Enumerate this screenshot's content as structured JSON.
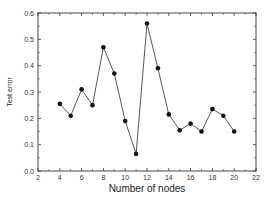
{
  "chart_data": {
    "type": "line",
    "title": "",
    "xlabel": "Number of  nodes",
    "ylabel": "Test error",
    "xlim": [
      2,
      22
    ],
    "ylim": [
      0.0,
      0.6
    ],
    "xticks": [
      2,
      4,
      6,
      8,
      10,
      12,
      14,
      16,
      18,
      20,
      22
    ],
    "yticks": [
      0.0,
      0.1,
      0.2,
      0.3,
      0.4,
      0.5,
      0.6
    ],
    "xtick_labels": [
      "2",
      "4",
      "6",
      "8",
      "10",
      "12",
      "14",
      "16",
      "18",
      "20",
      "22"
    ],
    "ytick_labels": [
      "0.0",
      "0.1",
      "0.2",
      "0.3",
      "0.4",
      "0.5",
      "0.6"
    ],
    "grid": false,
    "legend": null,
    "series": [
      {
        "name": "Test error",
        "marker": "circle",
        "color": "#111111",
        "x": [
          4,
          5,
          6,
          7,
          8,
          9,
          10,
          11,
          12,
          13,
          14,
          15,
          16,
          17,
          18,
          19,
          20
        ],
        "values": [
          0.255,
          0.21,
          0.31,
          0.25,
          0.47,
          0.37,
          0.19,
          0.065,
          0.56,
          0.39,
          0.215,
          0.155,
          0.18,
          0.15,
          0.235,
          0.21,
          0.15
        ]
      }
    ]
  }
}
